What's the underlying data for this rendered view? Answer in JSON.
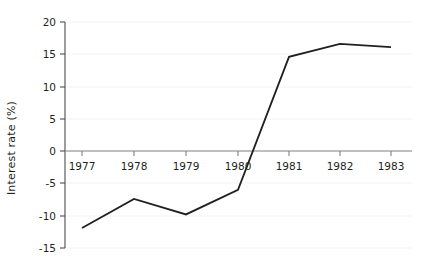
{
  "chart_data": {
    "type": "line",
    "title": "",
    "xlabel": "",
    "ylabel": "Interest rate (%)",
    "x": [
      1977,
      1978,
      1979,
      1980,
      1981,
      1982,
      1983
    ],
    "xtick_labels": [
      "1977",
      "1978",
      "1979",
      "1980",
      "1981",
      "1982",
      "1983"
    ],
    "ytick_labels": [
      "20",
      "15",
      "10",
      "5",
      "0",
      "-5",
      "-10",
      "-15"
    ],
    "yticks": [
      20,
      15,
      10,
      5,
      0,
      -5,
      -10,
      -15
    ],
    "values": [
      -11.9,
      -7.4,
      -9.8,
      -6.0,
      14.6,
      16.6,
      16.1
    ],
    "series": [
      {
        "name": "Interest rate",
        "values": [
          -11.9,
          -7.4,
          -9.8,
          -6.0,
          14.6,
          16.6,
          16.1
        ]
      }
    ],
    "xlim": [
      1976.5,
      1983.5
    ],
    "ylim": [
      -15,
      20
    ],
    "grid": true,
    "grid_axis": "y",
    "legend": "none",
    "line_color": "#231f20",
    "grid_color": "#f2f2f5",
    "axis_color": "#808080",
    "background_color": "#ffffff"
  }
}
